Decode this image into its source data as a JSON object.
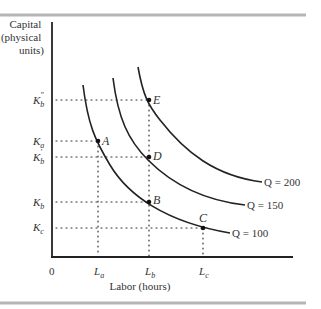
{
  "diagram": {
    "y_axis_label": [
      "Capital",
      "(physical",
      "units)"
    ],
    "x_axis_label": "Labor (hours)",
    "origin_label": "0",
    "y_ticks": [
      {
        "id": "Kb2",
        "base": "K",
        "sub": "b",
        "sup": "″"
      },
      {
        "id": "Ka",
        "base": "K",
        "sub": "a",
        "sup": ""
      },
      {
        "id": "Kb1",
        "base": "K",
        "sub": "b",
        "sup": "′"
      },
      {
        "id": "Kb",
        "base": "K",
        "sub": "b",
        "sup": ""
      },
      {
        "id": "Kc",
        "base": "K",
        "sub": "c",
        "sup": ""
      }
    ],
    "x_ticks": [
      {
        "id": "La",
        "base": "L",
        "sub": "a"
      },
      {
        "id": "Lb",
        "base": "L",
        "sub": "b"
      },
      {
        "id": "Lc",
        "base": "L",
        "sub": "c"
      }
    ],
    "isoquants": [
      {
        "label": "Q = 100"
      },
      {
        "label": "Q = 150"
      },
      {
        "label": "Q = 200"
      }
    ],
    "points": [
      {
        "label": "A",
        "on": "Q = 100",
        "labor": "La",
        "capital": "Ka"
      },
      {
        "label": "B",
        "on": "Q = 100",
        "labor": "Lb",
        "capital": "Kb"
      },
      {
        "label": "C",
        "on": "Q = 100",
        "labor": "Lc",
        "capital": "Kc"
      },
      {
        "label": "D",
        "on": "Q = 150",
        "labor": "Lb",
        "capital": "K′b"
      },
      {
        "label": "E",
        "on": "Q = 200",
        "labor": "Lb",
        "capital": "K″b"
      }
    ]
  }
}
